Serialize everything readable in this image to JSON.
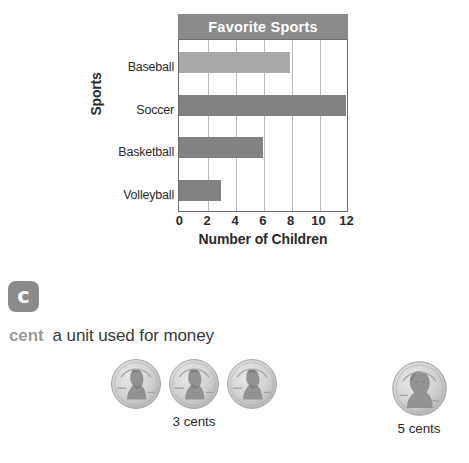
{
  "chart_data": {
    "type": "bar",
    "orientation": "horizontal",
    "title": "Favorite Sports",
    "xlabel": "Number of Children",
    "ylabel": "Sports",
    "categories": [
      "Baseball",
      "Soccer",
      "Basketball",
      "Volleyball"
    ],
    "values": [
      8,
      12,
      6,
      3
    ],
    "xticks": [
      "0",
      "2",
      "4",
      "6",
      "8",
      "10",
      "12"
    ],
    "xlim": [
      0,
      12
    ],
    "grid": true,
    "legend": "none",
    "bar_colors": [
      "#a9a9a9",
      "#828282",
      "#828282",
      "#828282"
    ],
    "title_bar_color": "#8a8a8a",
    "title_text_color": "#ffffff",
    "axis_color": "#6e6e6e",
    "gridline_color": "#b9b9b9"
  },
  "chart": {
    "title": "Favorite Sports",
    "y_axis_title": "Sports",
    "x_axis_title": "Number of Children"
  },
  "vocab": {
    "badge_letter": "c",
    "badge_icon_name": "letter-c-badge-icon",
    "term": "cent",
    "definition": "a unit used for money",
    "term_color": "#9a9a9a",
    "definition_color": "#3a3a3a"
  },
  "coins": {
    "groups": [
      {
        "name": "pennies",
        "coin_type": "penny",
        "count": 3,
        "caption": "3 cents",
        "inscription_top": "IN GOD WE TRUST",
        "inscription_left": "LIBERTY",
        "inscription_year": "2013"
      },
      {
        "name": "nickel",
        "coin_type": "nickel",
        "count": 1,
        "caption": "5 cents",
        "inscription_top": "IN GOD WE TRUST",
        "inscription_left": "LIBERTY",
        "inscription_year": "2013"
      }
    ]
  }
}
